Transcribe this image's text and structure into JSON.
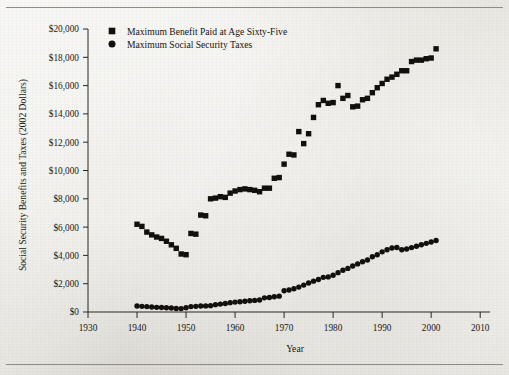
{
  "figure": {
    "background_color": "#e9e7e2",
    "ink_color": "#120f0d",
    "rule_color": "#8e8a84"
  },
  "axes": {
    "x_title": "Year",
    "y_title": "Social Security Benefits and Taxes (2002 Dollars)",
    "x_ticks": [
      "1930",
      "1940",
      "1950",
      "1960",
      "1970",
      "1980",
      "1990",
      "2000",
      "2010"
    ],
    "y_ticks": [
      "$0",
      "$2,000",
      "$4,000",
      "$6,000",
      "$8,000",
      "$10,000",
      "$12,000",
      "$14,000",
      "$16,000",
      "$18,000",
      "$20,000"
    ]
  },
  "legend": {
    "position": "top-left-inside",
    "items": [
      {
        "label": "Maximum Benefit Paid at Age Sixty-Five",
        "marker": "square",
        "color": "#120f0d"
      },
      {
        "label": "Maximum Social Security Taxes",
        "marker": "circle",
        "color": "#120f0d"
      }
    ]
  },
  "chart_data": {
    "type": "scatter",
    "title": "",
    "subtitle": "",
    "xlabel": "Year",
    "ylabel": "Social Security Benefits and Taxes (2002 Dollars)",
    "xlim": [
      1930,
      2012
    ],
    "ylim": [
      0,
      20000
    ],
    "grid": false,
    "legend_position": "upper left",
    "x_tick_values": [
      1930,
      1940,
      1950,
      1960,
      1970,
      1980,
      1990,
      2000,
      2010
    ],
    "y_tick_values": [
      0,
      2000,
      4000,
      6000,
      8000,
      10000,
      12000,
      14000,
      16000,
      18000,
      20000
    ],
    "y_tick_labels": [
      "$0",
      "$2,000",
      "$4,000",
      "$6,000",
      "$8,000",
      "$10,000",
      "$12,000",
      "$14,000",
      "$16,000",
      "$18,000",
      "$20,000"
    ],
    "series": [
      {
        "name": "Maximum Benefit Paid at Age Sixty-Five",
        "marker": "square",
        "color": "#120f0d",
        "x": [
          1940,
          1941,
          1942,
          1943,
          1944,
          1945,
          1946,
          1947,
          1948,
          1949,
          1950,
          1951,
          1952,
          1953,
          1954,
          1955,
          1956,
          1957,
          1958,
          1959,
          1960,
          1961,
          1962,
          1963,
          1964,
          1965,
          1966,
          1967,
          1968,
          1969,
          1970,
          1971,
          1972,
          1973,
          1974,
          1975,
          1976,
          1977,
          1978,
          1979,
          1980,
          1981,
          1982,
          1983,
          1984,
          1985,
          1986,
          1987,
          1988,
          1989,
          1990,
          1991,
          1992,
          1993,
          1994,
          1995,
          1996,
          1997,
          1998,
          1999,
          2000,
          2001
        ],
        "y": [
          6200,
          6050,
          5650,
          5450,
          5300,
          5200,
          5000,
          4750,
          4500,
          4100,
          4050,
          5550,
          5500,
          6850,
          6800,
          8000,
          8050,
          8150,
          8100,
          8400,
          8550,
          8650,
          8700,
          8650,
          8600,
          8500,
          8750,
          8750,
          9450,
          9500,
          10450,
          11150,
          11100,
          12750,
          11900,
          12600,
          13750,
          14650,
          14950,
          14750,
          14800,
          16000,
          15100,
          15300,
          14500,
          14550,
          15000,
          15100,
          15500,
          15850,
          16150,
          16450,
          16600,
          16800,
          17050,
          17050,
          17700,
          17800,
          17800,
          17900,
          17950,
          18600
        ]
      },
      {
        "name": "Maximum Social Security Taxes",
        "marker": "circle",
        "color": "#120f0d",
        "x": [
          1940,
          1941,
          1942,
          1943,
          1944,
          1945,
          1946,
          1947,
          1948,
          1949,
          1950,
          1951,
          1952,
          1953,
          1954,
          1955,
          1956,
          1957,
          1958,
          1959,
          1960,
          1961,
          1962,
          1963,
          1964,
          1965,
          1966,
          1967,
          1968,
          1969,
          1970,
          1971,
          1972,
          1973,
          1974,
          1975,
          1976,
          1977,
          1978,
          1979,
          1980,
          1981,
          1982,
          1983,
          1984,
          1985,
          1986,
          1987,
          1988,
          1989,
          1990,
          1991,
          1992,
          1993,
          1994,
          1995,
          1996,
          1997,
          1998,
          1999,
          2000,
          2001
        ],
        "y": [
          420,
          400,
          380,
          350,
          330,
          320,
          300,
          280,
          250,
          240,
          300,
          380,
          400,
          420,
          430,
          450,
          520,
          560,
          600,
          660,
          700,
          720,
          760,
          790,
          820,
          850,
          1000,
          1030,
          1080,
          1120,
          1500,
          1560,
          1640,
          1760,
          1900,
          2050,
          2180,
          2300,
          2450,
          2480,
          2600,
          2780,
          2950,
          3080,
          3250,
          3400,
          3550,
          3680,
          3900,
          4050,
          4250,
          4400,
          4520,
          4560,
          4400,
          4450,
          4550,
          4650,
          4750,
          4850,
          4950,
          5050
        ]
      }
    ]
  }
}
